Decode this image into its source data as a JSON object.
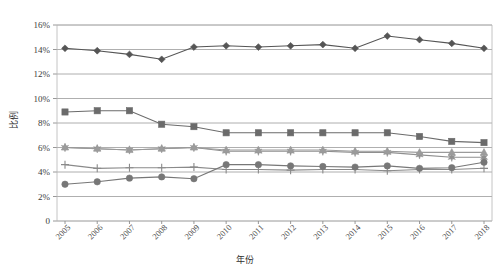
{
  "chart_data": {
    "type": "line",
    "title": "",
    "xlabel": "年份",
    "ylabel": "比例",
    "grid": true,
    "legend": "none",
    "ylim": [
      0,
      16
    ],
    "ytick_labels": [
      "16%",
      "14%",
      "12%",
      "10%",
      "8%",
      "6%",
      "4%",
      "2%",
      "0"
    ],
    "ytick_values": [
      16,
      14,
      12,
      10,
      8,
      6,
      4,
      2,
      0
    ],
    "categories": [
      "2005",
      "2006",
      "2007",
      "2008",
      "2009",
      "2010",
      "2011",
      "2012",
      "2013",
      "2014",
      "2015",
      "2016",
      "2017",
      "2018"
    ],
    "series": [
      {
        "name": "series-diamond",
        "marker": "diamond",
        "color": "#555555",
        "values": [
          14.1,
          13.9,
          13.6,
          13.2,
          14.2,
          14.3,
          14.2,
          14.3,
          14.4,
          14.1,
          15.1,
          14.8,
          14.5,
          14.1
        ]
      },
      {
        "name": "series-square",
        "marker": "square",
        "color": "#6b6b6b",
        "values": [
          8.9,
          9.0,
          9.0,
          7.9,
          7.7,
          7.2,
          7.2,
          7.2,
          7.2,
          7.2,
          7.2,
          6.9,
          6.5,
          6.4
        ]
      },
      {
        "name": "series-star",
        "marker": "star",
        "color": "#8f8f8f",
        "values": [
          6.0,
          5.9,
          5.8,
          5.9,
          6.0,
          5.7,
          5.7,
          5.7,
          5.7,
          5.6,
          5.6,
          5.4,
          5.2,
          5.2
        ]
      },
      {
        "name": "series-triangle",
        "marker": "triangle",
        "color": "#9b9b9b",
        "values": [
          6.0,
          5.9,
          5.8,
          5.9,
          6.0,
          5.8,
          5.8,
          5.8,
          5.8,
          5.7,
          5.7,
          5.6,
          5.6,
          5.6
        ]
      },
      {
        "name": "series-plus",
        "marker": "plus",
        "color": "#8a8a8a",
        "values": [
          4.6,
          4.3,
          4.35,
          4.35,
          4.4,
          4.2,
          4.2,
          4.15,
          4.2,
          4.2,
          4.1,
          4.2,
          4.2,
          4.3
        ]
      },
      {
        "name": "series-circle",
        "marker": "circle",
        "color": "#777777",
        "values": [
          3.0,
          3.2,
          3.5,
          3.6,
          3.45,
          4.6,
          4.6,
          4.5,
          4.45,
          4.4,
          4.5,
          4.3,
          4.35,
          4.8
        ]
      }
    ]
  }
}
